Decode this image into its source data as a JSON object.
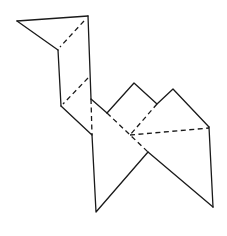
{
  "diagram": {
    "stroke_color": "#1a1a1a",
    "background": "#ffffff",
    "solid_lines": [
      {
        "name": "head-top",
        "points": [
          [
            17,
            21
          ],
          [
            88,
            16
          ]
        ]
      },
      {
        "name": "head-underside",
        "points": [
          [
            17,
            21
          ],
          [
            58,
            50
          ]
        ]
      },
      {
        "name": "neck-front",
        "points": [
          [
            58,
            50
          ],
          [
            61,
            106
          ]
        ]
      },
      {
        "name": "neck-back",
        "points": [
          [
            88,
            16
          ],
          [
            91,
            99
          ]
        ]
      },
      {
        "name": "chest",
        "points": [
          [
            61,
            106
          ],
          [
            92,
            135
          ]
        ]
      },
      {
        "name": "back-to-hump",
        "points": [
          [
            91,
            99
          ],
          [
            107,
            113
          ]
        ]
      },
      {
        "name": "humps",
        "points": [
          [
            107,
            113
          ],
          [
            134,
            83
          ],
          [
            157,
            104
          ],
          [
            173,
            89
          ],
          [
            209,
            127
          ]
        ]
      },
      {
        "name": "front-leg",
        "points": [
          [
            92,
            135
          ],
          [
            96,
            212
          ],
          [
            148,
            152
          ]
        ]
      },
      {
        "name": "rear-leg-inner",
        "points": [
          [
            148,
            152
          ],
          [
            213,
            207
          ]
        ]
      },
      {
        "name": "rear-leg-outer",
        "points": [
          [
            209,
            127
          ],
          [
            213,
            207
          ]
        ]
      }
    ],
    "fold_lines": [
      {
        "name": "head-fold",
        "points": [
          [
            84,
            21
          ],
          [
            60,
            47
          ]
        ]
      },
      {
        "name": "neck-fold",
        "points": [
          [
            88,
            78
          ],
          [
            63,
            104
          ]
        ]
      },
      {
        "name": "body-vertical-fold",
        "points": [
          [
            91,
            99
          ],
          [
            92,
            135
          ]
        ]
      },
      {
        "name": "body-diagonal-fold",
        "points": [
          [
            107,
            113
          ],
          [
            148,
            152
          ]
        ]
      },
      {
        "name": "hump-fold",
        "points": [
          [
            157,
            104
          ],
          [
            130,
            135
          ]
        ]
      },
      {
        "name": "rear-fold",
        "points": [
          [
            130,
            135
          ],
          [
            209,
            128
          ]
        ]
      }
    ]
  }
}
